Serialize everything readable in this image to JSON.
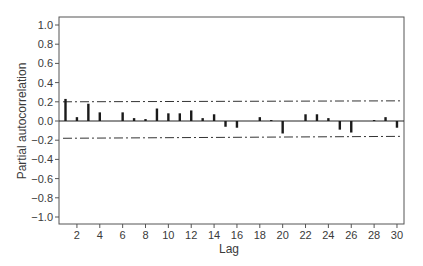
{
  "chart_data": {
    "type": "bar",
    "title": "",
    "xlabel": "Lag",
    "ylabel": "Partial autocorrelation",
    "xlim": [
      0.5,
      30.8
    ],
    "ylim": [
      -1.1,
      1.1
    ],
    "x_ticks": [
      2,
      4,
      6,
      8,
      10,
      12,
      14,
      16,
      18,
      20,
      22,
      24,
      26,
      28,
      30
    ],
    "y_ticks": [
      1.0,
      0.8,
      0.6,
      0.4,
      0.2,
      0.0,
      -0.2,
      -0.4,
      -0.6,
      -0.8,
      -1.0
    ],
    "y_tick_labels": [
      "1.0",
      "0.8",
      "0.6",
      "0.4",
      "0.2",
      "0.0",
      "−0.2",
      "−0.4",
      "−0.6",
      "−0.8",
      "−1.0"
    ],
    "grid": false,
    "legend": null,
    "series": [
      {
        "name": "PACF",
        "x": [
          1,
          2,
          3,
          4,
          5,
          6,
          7,
          8,
          9,
          10,
          11,
          12,
          13,
          14,
          15,
          16,
          17,
          18,
          19,
          20,
          21,
          22,
          23,
          24,
          25,
          26,
          27,
          28,
          29,
          30
        ],
        "values": [
          0.23,
          0.04,
          0.18,
          0.09,
          0.0,
          0.09,
          0.03,
          0.02,
          0.13,
          0.08,
          0.08,
          0.11,
          0.03,
          0.07,
          -0.06,
          -0.07,
          0.0,
          0.04,
          0.01,
          -0.13,
          0.0,
          0.07,
          0.07,
          0.03,
          -0.09,
          -0.12,
          0.0,
          0.01,
          0.04,
          -0.07
        ]
      }
    ],
    "confidence_bands": {
      "style": "dash-dot",
      "upper": {
        "start": 0.2,
        "end": 0.21
      },
      "lower": {
        "start": -0.18,
        "end": -0.16
      }
    }
  },
  "colors": {
    "bars": "#1a1a1a",
    "axis": "#555555",
    "bands": "#333333",
    "text": "#3a3a3a"
  },
  "labels": {
    "xlabel": "Lag",
    "ylabel": "Partial autocorrelation"
  }
}
